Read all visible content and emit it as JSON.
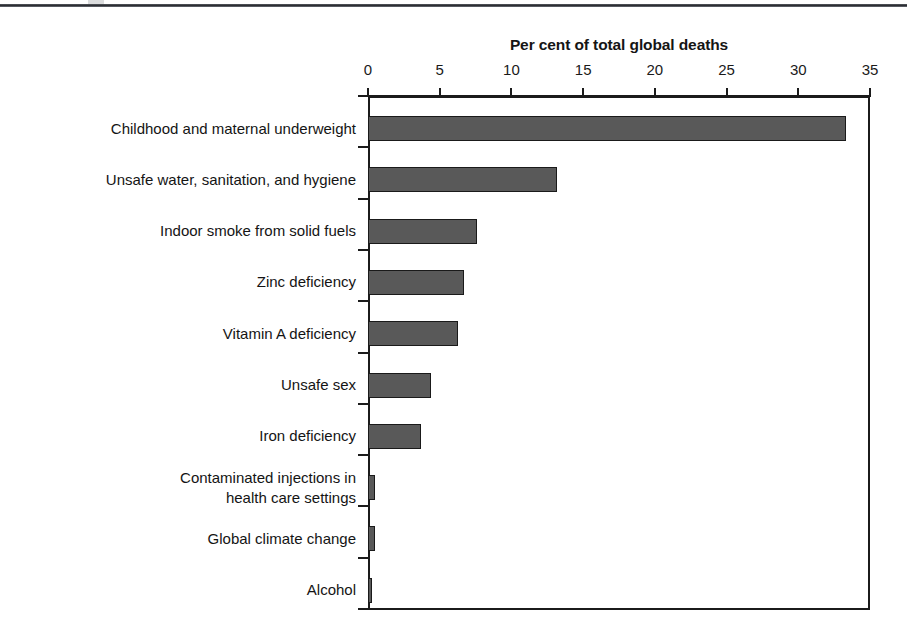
{
  "figure": {
    "top_rule": "horizontal-rule",
    "background_color": "#ffffff"
  },
  "chart_data": {
    "type": "bar",
    "orientation": "horizontal",
    "title": "Per cent of total global deaths",
    "xlabel": "",
    "ylabel": "",
    "xlim": [
      0,
      35
    ],
    "xticks": [
      0,
      5,
      10,
      15,
      20,
      25,
      30,
      35
    ],
    "xtick_labels": [
      "0",
      "5",
      "10",
      "15",
      "20",
      "25",
      "30",
      "35"
    ],
    "grid": false,
    "legend": null,
    "bar_color": "#595959",
    "bar_edge_color": "#1a1a1a",
    "categories": [
      "Childhood and maternal underweight",
      "Unsafe water, sanitation, and hygiene",
      "Indoor smoke from solid fuels",
      "Zinc deficiency",
      "Vitamin A deficiency",
      "Unsafe sex",
      "Iron deficiency",
      "Contaminated injections in\nhealth care settings",
      "Global climate change",
      "Alcohol"
    ],
    "category_lines": [
      [
        "Childhood and maternal underweight"
      ],
      [
        "Unsafe water, sanitation, and hygiene"
      ],
      [
        "Indoor smoke from solid fuels"
      ],
      [
        "Zinc deficiency"
      ],
      [
        "Vitamin A deficiency"
      ],
      [
        "Unsafe sex"
      ],
      [
        "Iron deficiency"
      ],
      [
        "Contaminated injections in",
        "health care settings"
      ],
      [
        "Global climate change"
      ],
      [
        "Alcohol"
      ]
    ],
    "values": [
      33.3,
      13.2,
      7.6,
      6.7,
      6.3,
      4.4,
      3.7,
      0.5,
      0.5,
      0.3
    ]
  }
}
